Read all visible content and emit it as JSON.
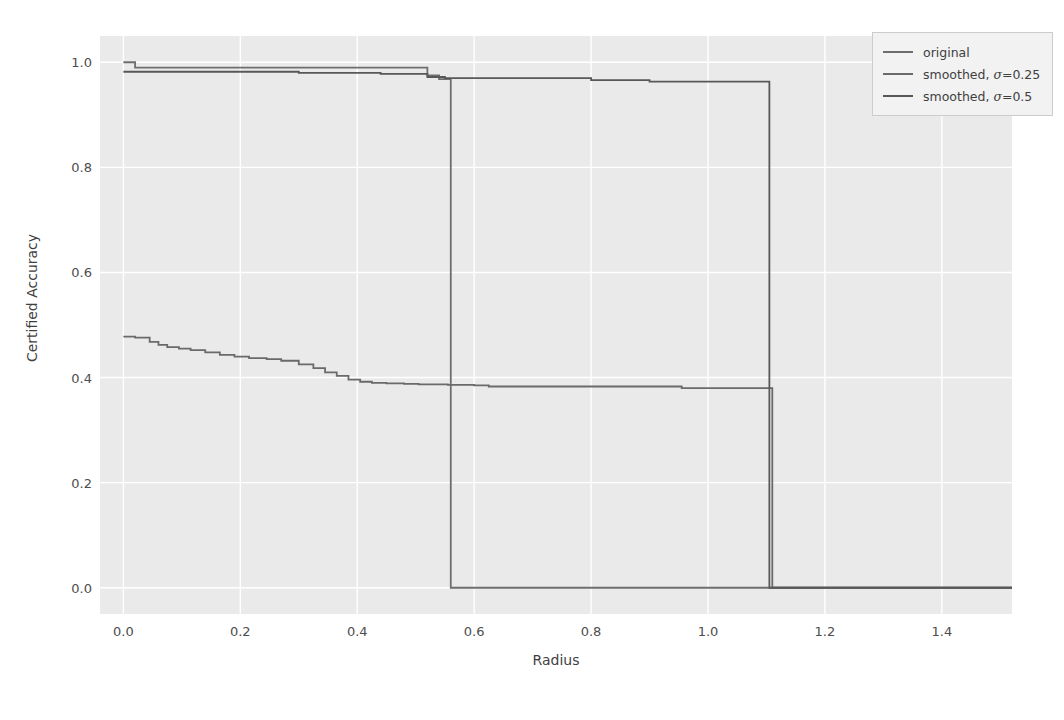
{
  "chart_data": {
    "type": "line",
    "title": "",
    "xlabel": "Radius",
    "ylabel": "Certified Accuracy",
    "xlim": [
      -0.04,
      1.52
    ],
    "ylim": [
      -0.05,
      1.05
    ],
    "xticks": [
      "0.0",
      "0.2",
      "0.4",
      "0.6",
      "0.8",
      "1.0",
      "1.2",
      "1.4"
    ],
    "xtick_values": [
      0.0,
      0.2,
      0.4,
      0.6,
      0.8,
      1.0,
      1.2,
      1.4
    ],
    "yticks": [
      "0.0",
      "0.2",
      "0.4",
      "0.6",
      "0.8",
      "1.0"
    ],
    "ytick_values": [
      0.0,
      0.2,
      0.4,
      0.6,
      0.8,
      1.0
    ],
    "grid": true,
    "grid_color": "#ffffff",
    "plot_bg": "#eaeaea",
    "figure_bg": "#ffffff",
    "legend_position": "upper right",
    "drawstyle": "steps-post",
    "series": [
      {
        "name": "original",
        "color": "#6e6e6e",
        "x": [
          0.0,
          0.02,
          0.5,
          0.52,
          0.54,
          0.56
        ],
        "y": [
          1.0,
          0.99,
          0.99,
          0.975,
          0.968,
          0.0
        ]
      },
      {
        "name": "smoothed, σ=0.25",
        "color": "#6a6a6a",
        "x": [
          0.0,
          0.02,
          0.045,
          0.06,
          0.075,
          0.095,
          0.115,
          0.14,
          0.165,
          0.19,
          0.215,
          0.245,
          0.27,
          0.3,
          0.325,
          0.345,
          0.365,
          0.385,
          0.405,
          0.425,
          0.45,
          0.48,
          0.505,
          0.555,
          0.6,
          0.625,
          0.9,
          0.955,
          1.105,
          1.11,
          1.52
        ],
        "y": [
          0.478,
          0.476,
          0.468,
          0.462,
          0.458,
          0.455,
          0.452,
          0.448,
          0.443,
          0.44,
          0.437,
          0.435,
          0.432,
          0.425,
          0.418,
          0.41,
          0.403,
          0.396,
          0.392,
          0.39,
          0.389,
          0.388,
          0.387,
          0.386,
          0.385,
          0.383,
          0.383,
          0.38,
          0.38,
          0.0,
          0.0
        ]
      },
      {
        "name": "smoothed, σ=0.5",
        "color": "#585858",
        "x": [
          0.0,
          0.03,
          0.28,
          0.3,
          0.42,
          0.44,
          0.5,
          0.52,
          0.55,
          0.6,
          0.78,
          0.8,
          0.88,
          0.9,
          1.1,
          1.105,
          1.52
        ],
        "y": [
          0.982,
          0.982,
          0.982,
          0.98,
          0.98,
          0.978,
          0.978,
          0.972,
          0.97,
          0.97,
          0.97,
          0.966,
          0.966,
          0.963,
          0.963,
          0.0,
          0.0
        ]
      }
    ]
  },
  "legend": {
    "items": [
      {
        "label_prefix": "original",
        "sigma": "",
        "color": "#6e6e6e"
      },
      {
        "label_prefix": "smoothed, ",
        "sigma": "=0.25",
        "color": "#6a6a6a"
      },
      {
        "label_prefix": "smoothed, ",
        "sigma": "=0.5",
        "color": "#585858"
      }
    ],
    "sigma_symbol": "σ"
  }
}
